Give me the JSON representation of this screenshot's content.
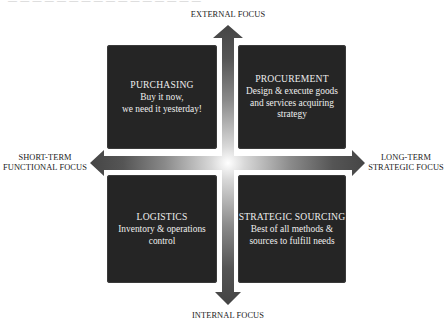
{
  "top_cutoff_text": "— — — — — — — — — — — — — — — —",
  "axes": {
    "top": "EXTERNAL FOCUS",
    "bottom": "INTERNAL FOCUS",
    "left_line1": "SHORT-TERM",
    "left_line2": "FUNCTIONAL FOCUS",
    "right_line1": "LONG-TERM",
    "right_line2": "STRATEGIC FOCUS"
  },
  "quadrants": {
    "top_left": {
      "title": "PURCHASING",
      "desc_line1": "Buy it now,",
      "desc_line2": "we need it yesterday!",
      "desc_line3": ""
    },
    "top_right": {
      "title": "PROCUREMENT",
      "desc_line1": "Design & execute goods",
      "desc_line2": "and services acquiring",
      "desc_line3": "strategy"
    },
    "bottom_left": {
      "title": "LOGISTICS",
      "desc_line1": "Inventory & operations",
      "desc_line2": "control",
      "desc_line3": ""
    },
    "bottom_right": {
      "title": "STRATEGIC SOURCING",
      "desc_line1": "Best of all methods &",
      "desc_line2": "sources to fulfill needs",
      "desc_line3": ""
    }
  },
  "colors": {
    "box_fill": "#252525",
    "arrow_dark": "#4a4a4a",
    "arrow_center": "#ffffff",
    "text_light": "#eeeeee",
    "text_dark": "#222222"
  }
}
